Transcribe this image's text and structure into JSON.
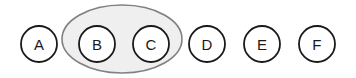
{
  "canvas": {
    "width": 356,
    "height": 78,
    "background": "#ffffff"
  },
  "diagram": {
    "type": "set-grouping",
    "node_radius": 18,
    "node_center_y": 44,
    "node_stroke": "#1a1a1a",
    "node_fill": "#ffffff",
    "node_stroke_width": 1.8,
    "label_color": "#1a1a1a",
    "nodes": [
      {
        "id": "A",
        "label": "A",
        "cx": 39,
        "cy": 44,
        "grouped": false
      },
      {
        "id": "B",
        "label": "B",
        "cx": 97,
        "cy": 44,
        "grouped": true
      },
      {
        "id": "C",
        "label": "C",
        "cx": 151,
        "cy": 44,
        "grouped": true
      },
      {
        "id": "D",
        "label": "D",
        "cx": 207,
        "cy": 44,
        "grouped": false
      },
      {
        "id": "E",
        "label": "E",
        "cx": 262,
        "cy": 44,
        "grouped": false
      },
      {
        "id": "F",
        "label": "F",
        "cx": 317,
        "cy": 44,
        "grouped": false
      }
    ],
    "group": {
      "id": "group-bc",
      "members": [
        "B",
        "C"
      ],
      "cx": 122,
      "cy": 39,
      "rx": 60,
      "ry": 34,
      "fill": "#efefef",
      "stroke": "#808080",
      "stroke_width": 1.6
    }
  }
}
